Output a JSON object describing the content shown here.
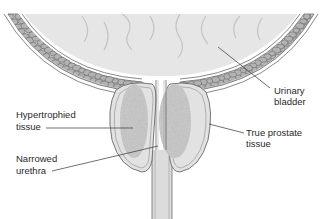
{
  "diagram": {
    "labels": {
      "urinary_bladder": [
        "Urinary",
        "bladder"
      ],
      "hypertrophied_tissue": [
        "Hypertrophied",
        "tissue"
      ],
      "true_prostate_tissue": [
        "True prostate",
        "tissue"
      ],
      "narrowed_urethra": [
        "Narrowed",
        "urethra"
      ]
    },
    "colors": {
      "bladder_fill": "#e6e6e6",
      "wall_fill": "#cfcfcf",
      "cell_fill": "#b3b3b3",
      "outline": "#6a6a6a",
      "prostate_fill": "#e2e2e2",
      "stipple": "#9a9a9a",
      "urethra_fill": "#dcdcdc"
    }
  }
}
